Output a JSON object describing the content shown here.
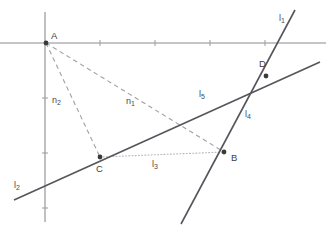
{
  "figure": {
    "width": 329,
    "height": 236,
    "background_color": "#ffffff"
  },
  "style": {
    "axis_color": "#8c8c92",
    "solid_line_color": "#55555b",
    "dashed_line_color": "#a0a0a6",
    "dotted_line_color": "#b8b8be",
    "point_color": "#3a3a3a",
    "label_color": "#4a4a4a"
  },
  "axes": {
    "origin": {
      "x": 45,
      "y": 43
    },
    "x_axis": {
      "x1": 0,
      "y1": 43,
      "x2": 326,
      "y2": 43
    },
    "y_axis": {
      "x1": 45,
      "y1": 12,
      "x2": 45,
      "y2": 222
    },
    "x_ticks": [
      100,
      155,
      210,
      265
    ],
    "y_ticks": [
      98,
      153,
      208
    ]
  },
  "points": [
    {
      "id": "A",
      "label": "A",
      "x": 46,
      "y": 43,
      "label_x": 51,
      "label_y": 31
    },
    {
      "id": "B",
      "label": "B",
      "x": 224,
      "y": 152,
      "label_x": 231,
      "label_y": 153
    },
    {
      "id": "C",
      "label": "C",
      "x": 100,
      "y": 157,
      "label_x": 96,
      "label_y": 164
    },
    {
      "id": "D",
      "label": "D",
      "x": 266,
      "y": 76,
      "label_x": 259,
      "label_y": 59
    }
  ],
  "lines": [
    {
      "id": "l5",
      "label": "l",
      "sub": "5",
      "style": "solid",
      "description": "long solid line from lower-left through C and D to right edge",
      "x1": 14,
      "y1": 200,
      "x2": 320,
      "y2": 62,
      "label_x": 199,
      "label_y": 90
    },
    {
      "id": "l2",
      "label": "l",
      "sub": "2",
      "style": "solid",
      "description": "label for lower-left end of the same long solid line",
      "x1": 14,
      "y1": 200,
      "x2": 14,
      "y2": 200,
      "label_x": 14,
      "label_y": 181
    },
    {
      "id": "l4",
      "label": "l",
      "sub": "4",
      "style": "solid",
      "description": "steep solid line from bottom through B and D to upper right",
      "x1": 181,
      "y1": 224,
      "x2": 295,
      "y2": 10,
      "label_x": 245,
      "label_y": 110
    },
    {
      "id": "l1",
      "label": "l",
      "sub": "1",
      "style": "solid",
      "description": "label for upper end of the steep solid line",
      "x1": 295,
      "y1": 10,
      "x2": 295,
      "y2": 10,
      "label_x": 279,
      "label_y": 14
    },
    {
      "id": "l3",
      "label": "l",
      "sub": "3",
      "style": "dotted",
      "description": "dotted segment from C to B",
      "x1": 100,
      "y1": 157,
      "x2": 224,
      "y2": 152,
      "label_x": 152,
      "label_y": 160
    },
    {
      "id": "n1",
      "label": "n",
      "sub": "1",
      "style": "dashed",
      "description": "dashed segment from A to B",
      "x1": 46,
      "y1": 43,
      "x2": 224,
      "y2": 152,
      "label_x": 126,
      "label_y": 97
    },
    {
      "id": "n2",
      "label": "n",
      "sub": "2",
      "style": "dashed",
      "description": "dashed segment from A to C",
      "x1": 46,
      "y1": 43,
      "x2": 100,
      "y2": 157,
      "label_x": 52,
      "label_y": 96
    }
  ]
}
